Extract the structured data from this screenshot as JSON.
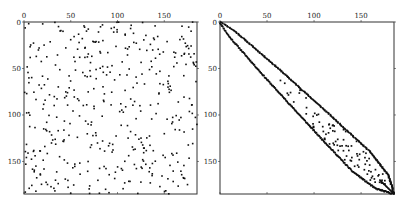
{
  "chart_data": [
    {
      "type": "scatter",
      "subtype": "spy",
      "title": "",
      "description": "Sparsity pattern of a random sparse symmetric matrix (original ordering)",
      "matrix_size": 185,
      "xlim": [
        0,
        185
      ],
      "ylim": [
        185,
        0
      ],
      "x_ticks": [
        0,
        50,
        100,
        150
      ],
      "y_ticks": [
        0,
        50,
        100,
        150
      ],
      "x_tick_labels": [
        "0",
        "50",
        "100",
        "150"
      ],
      "y_tick_labels": [
        "0",
        "50",
        "100",
        "150"
      ],
      "xaxis_position": "top",
      "grid": false,
      "legend": null,
      "pattern": "uniform-random",
      "approx_nonzeros": 430,
      "seed": 7
    },
    {
      "type": "scatter",
      "subtype": "spy",
      "title": "",
      "description": "Sparsity pattern after bandwidth-reducing reordering (banded, widening band along diagonal)",
      "matrix_size": 185,
      "xlim": [
        0,
        185
      ],
      "ylim": [
        185,
        0
      ],
      "x_ticks": [
        0,
        50,
        100,
        150
      ],
      "y_ticks": [
        0,
        50,
        100,
        150
      ],
      "x_tick_labels": [
        "0",
        "50",
        "100",
        "150"
      ],
      "y_tick_labels": [
        "0",
        "50",
        "100",
        "150"
      ],
      "xaxis_position": "top",
      "grid": false,
      "legend": null,
      "pattern": "banded",
      "band_halfwidth_profile": [
        [
          0,
          1
        ],
        [
          10,
          6
        ],
        [
          50,
          12
        ],
        [
          100,
          17
        ],
        [
          140,
          20
        ],
        [
          165,
          14
        ],
        [
          178,
          5
        ],
        [
          185,
          0
        ]
      ],
      "interior_nonzeros": 90,
      "seed": 11
    }
  ],
  "colors": {
    "dot": "#111111",
    "axis": "#333333",
    "background": "#ffffff"
  },
  "panels": {
    "left": {
      "x": 24,
      "y": 22,
      "w": 173,
      "h": 172
    },
    "right": {
      "x": 220,
      "y": 22,
      "w": 174,
      "h": 172
    }
  }
}
